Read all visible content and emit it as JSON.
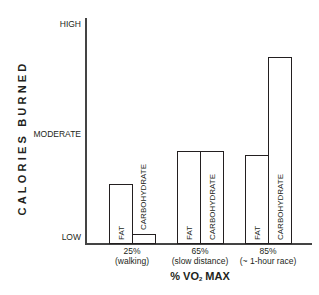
{
  "chart_data": {
    "type": "bar",
    "title": "",
    "xlabel": "% VO2 MAX",
    "ylabel": "CALORIES BURNED",
    "y_tick_labels": [
      "LOW",
      "MODERATE",
      "HIGH"
    ],
    "y_tick_values": [
      0,
      50,
      100
    ],
    "ylim": [
      0,
      100
    ],
    "grid": false,
    "legend": "none (bars labeled inline)",
    "categories": [
      "25% (walking)",
      "65% (slow distance)",
      "85% (~ 1-hour race)"
    ],
    "category_lines": [
      [
        "25%",
        "(walking)"
      ],
      [
        "65%",
        "(slow distance)"
      ],
      [
        "85%",
        "(~ 1-hour race)"
      ]
    ],
    "series": [
      {
        "name": "FAT",
        "values": [
          27,
          42,
          40
        ]
      },
      {
        "name": "CARBOHYDRATE",
        "values": [
          4,
          42,
          85
        ]
      }
    ]
  },
  "labels": {
    "y_title": "CALORIES BURNED",
    "y_high": "HIGH",
    "y_moderate": "MODERATE",
    "y_low": "LOW",
    "x_title_prefix": "% VO",
    "x_title_sub": "2",
    "x_title_suffix": " MAX",
    "fat": "FAT",
    "carb": "CARBOHYDRATE"
  }
}
